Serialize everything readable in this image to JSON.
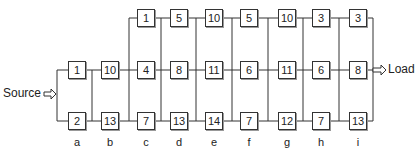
{
  "source_label": "Source",
  "load_label": "Load",
  "columns": [
    {
      "label": "a",
      "top": null,
      "middle": "1",
      "bottom": "2"
    },
    {
      "label": "b",
      "top": null,
      "middle": "10",
      "bottom": "13"
    },
    {
      "label": "c",
      "top": "1",
      "middle": "4",
      "bottom": "7"
    },
    {
      "label": "d",
      "top": "5",
      "middle": "8",
      "bottom": "13"
    },
    {
      "label": "e",
      "top": "10",
      "middle": "11",
      "bottom": "14"
    },
    {
      "label": "f",
      "top": "5",
      "middle": "6",
      "bottom": "7"
    },
    {
      "label": "g",
      "top": "10",
      "middle": "11",
      "bottom": "12"
    },
    {
      "label": "h",
      "top": "3",
      "middle": "6",
      "bottom": "7"
    },
    {
      "label": "i",
      "top": "3",
      "middle": "8",
      "bottom": "13"
    }
  ]
}
